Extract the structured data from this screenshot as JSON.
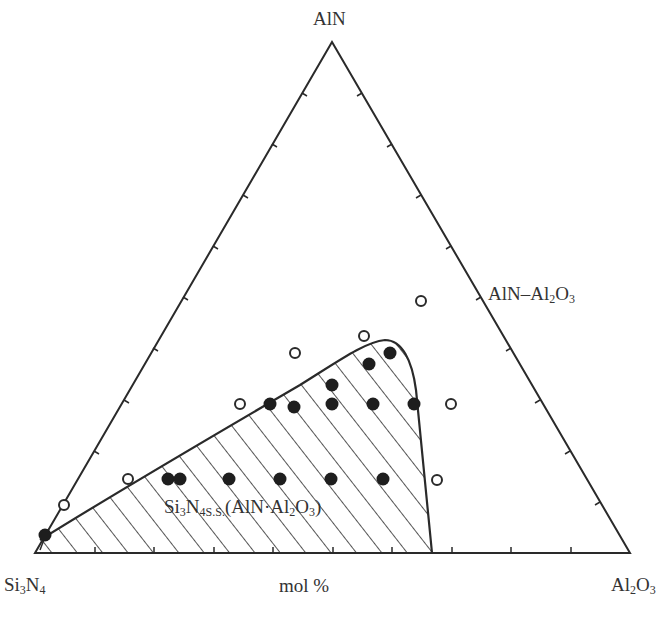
{
  "diagram": {
    "type": "ternary-phase-diagram",
    "vertices": {
      "top": "AlN",
      "bottom_left": "Si3N4",
      "bottom_right": "Al2O3"
    },
    "vertex_labels": {
      "top": {
        "main": "AlN"
      },
      "bottom_left": {
        "p1": "Si",
        "s1": "3",
        "p2": "N",
        "s2": "4"
      },
      "bottom_right": {
        "p1": "Al",
        "s1": "2",
        "p2": "O",
        "s2": "3"
      }
    },
    "axis_label": "mol %",
    "join_label": {
      "p1": "AlN–Al",
      "s1": "2",
      "p2": "O",
      "s2": "3"
    },
    "region_label": {
      "p1": "Si",
      "s1": "3",
      "p2": "N",
      "s2": "4",
      "ss": "S.S.",
      "p3": "(AlN·Al",
      "s3": "2",
      "p4": "O",
      "s4": "3",
      "p5": ")"
    },
    "tick_divisions": 10,
    "colors": {
      "line": "#2a2a2a",
      "hatch": "#2a2a2a",
      "background": "#ffffff"
    },
    "legend_semantics": {
      "filled_circle": "single phase (Si3N4 solid solution)",
      "open_circle": "outside solid-solution region"
    }
  },
  "chart_data": {
    "type": "scatter",
    "subtype": "ternary",
    "title": "",
    "components": [
      "Si3N4",
      "AlN",
      "Al2O3"
    ],
    "xlabel": "mol %",
    "region": {
      "name": "Si3N4 S.S. (AlN·Al2O3)",
      "fill": "hatched",
      "approx_bounds_mol_pct": "Al2O3 0–67, AlN 0–35"
    },
    "series": [
      {
        "name": "solid solution (filled)",
        "marker": "filled-circle",
        "points_mol_pct": [
          {
            "Si3N4": 98,
            "AlN": 3,
            "Al2O3": 0
          },
          {
            "Si3N4": 72,
            "AlN": 14,
            "Al2O3": 14
          },
          {
            "Si3N4": 70,
            "AlN": 14,
            "Al2O3": 16
          },
          {
            "Si3N4": 63,
            "AlN": 14,
            "Al2O3": 23
          },
          {
            "Si3N4": 54,
            "AlN": 14,
            "Al2O3": 32
          },
          {
            "Si3N4": 46,
            "AlN": 14,
            "Al2O3": 40
          },
          {
            "Si3N4": 37,
            "AlN": 14,
            "Al2O3": 49
          },
          {
            "Si3N4": 57,
            "AlN": 29,
            "Al2O3": 14
          },
          {
            "Si3N4": 53,
            "AlN": 29,
            "Al2O3": 18
          },
          {
            "Si3N4": 44,
            "AlN": 33,
            "Al2O3": 23
          },
          {
            "Si3N4": 46,
            "AlN": 29,
            "Al2O3": 25
          },
          {
            "Si3N4": 39,
            "AlN": 29,
            "Al2O3": 32
          },
          {
            "Si3N4": 32,
            "AlN": 29,
            "Al2O3": 39
          },
          {
            "Si3N4": 37,
            "AlN": 37,
            "Al2O3": 26
          },
          {
            "Si3N4": 34,
            "AlN": 39,
            "Al2O3": 27
          }
        ]
      },
      {
        "name": "outside region (open)",
        "marker": "open-circle",
        "points_mol_pct": [
          {
            "Si3N4": 92,
            "AlN": 9,
            "Al2O3": 0
          },
          {
            "Si3N4": 80,
            "AlN": 14,
            "Al2O3": 6
          },
          {
            "Si3N4": 60,
            "AlN": 29,
            "Al2O3": 11
          },
          {
            "Si3N4": 48,
            "AlN": 39,
            "Al2O3": 13
          },
          {
            "Si3N4": 39,
            "AlN": 42,
            "Al2O3": 19
          },
          {
            "Si3N4": 26,
            "AlN": 49,
            "Al2O3": 25
          },
          {
            "Si3N4": 25,
            "AlN": 29,
            "Al2O3": 46
          },
          {
            "Si3N4": 28,
            "AlN": 14,
            "Al2O3": 58
          }
        ]
      }
    ],
    "pixel_points": {
      "filled": [
        [
          45,
          535
        ],
        [
          168,
          479
        ],
        [
          180,
          479
        ],
        [
          229,
          479
        ],
        [
          280,
          479
        ],
        [
          331,
          479
        ],
        [
          383,
          479
        ],
        [
          270,
          404
        ],
        [
          294,
          407
        ],
        [
          332,
          385
        ],
        [
          332,
          404
        ],
        [
          373,
          404
        ],
        [
          414,
          404
        ],
        [
          369,
          364
        ],
        [
          390,
          353
        ]
      ],
      "open": [
        [
          64,
          505
        ],
        [
          128,
          479
        ],
        [
          240,
          404
        ],
        [
          295,
          353
        ],
        [
          364,
          336
        ],
        [
          421,
          301
        ],
        [
          451,
          404
        ],
        [
          437,
          480
        ]
      ]
    },
    "grid": false,
    "legend": "none"
  }
}
